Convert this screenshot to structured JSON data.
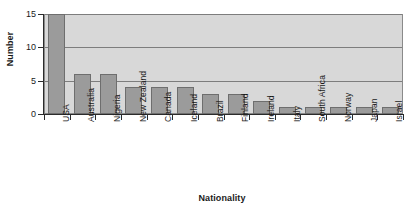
{
  "chart_data": {
    "type": "bar",
    "title": "",
    "xlabel": "Nationality",
    "ylabel": "Number",
    "categories": [
      "USA",
      "Australia",
      "Nigeria",
      "New Zealand",
      "Canada",
      "Iceland",
      "Brazil",
      "Finland",
      "Ireland",
      "Italy",
      "South Africa",
      "Norway",
      "Japan",
      "Israel"
    ],
    "values": [
      15,
      6,
      6,
      4,
      4,
      4,
      3,
      3,
      2,
      1,
      1,
      1,
      1,
      1
    ],
    "ylim": [
      0,
      15
    ],
    "yticks": [
      0,
      5,
      10,
      15
    ],
    "ytick_labels": [
      "0",
      "5",
      "10",
      "15"
    ],
    "grid": true,
    "grid_axis": "y",
    "legend": "none",
    "orientation": "vertical",
    "xtick_label_rotation": 90,
    "colors": {
      "bar_fill": "#9b9b9b",
      "bar_edge": "#6e6e6e",
      "plot_background": "#d8d8d8",
      "gridline": "#7d7d7d",
      "axis": "#2b2b2b",
      "text": "#1a1a1a",
      "figure_background": "#ffffff"
    }
  }
}
